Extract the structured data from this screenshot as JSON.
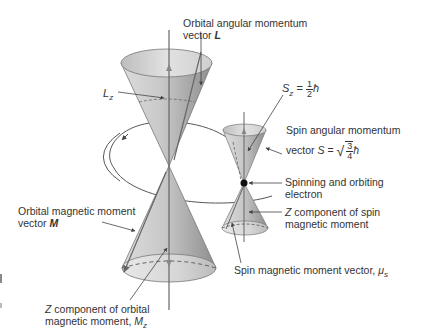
{
  "labels": {
    "orbital_L_line1": "Orbital angular momentum",
    "orbital_L_line2_prefix": "vector ",
    "orbital_L_symbol": "L",
    "Lz_symbol": "L",
    "Lz_sub": "z",
    "Sz_symbol": "S",
    "Sz_sub": "z",
    "Sz_eq": " = ",
    "Sz_num": "1",
    "Sz_den": "2",
    "Sz_hbar": "ħ",
    "spin_L_line1": "Spin angular momentum",
    "spin_L_line2_prefix": "vector ",
    "spin_L_symbol": "S",
    "spin_L_eq": " = ",
    "spin_num": "3",
    "spin_den": "4",
    "spin_hbar": "ħ",
    "electron_line1": "Spinning and orbiting",
    "electron_line2": "electron",
    "z_spin_line1_prefix": " component of spin",
    "z_spin_Z": "Z",
    "z_spin_line2": "magnetic moment",
    "orbital_M_line1": "Orbital magnetic moment",
    "orbital_M_line2_prefix": "vector ",
    "orbital_M_symbol": "M",
    "spin_mu_text": "Spin magnetic moment vector, ",
    "spin_mu_symbol": "μ",
    "spin_mu_sub": "s",
    "z_orbital_Z": "Z",
    "z_orbital_line1": " component of orbital",
    "z_orbital_line2_prefix": "magnetic moment, ",
    "z_orbital_symbol": "M",
    "z_orbital_sub": "z"
  },
  "colors": {
    "cone_light": "#e6e6e6",
    "cone_mid": "#c4c4c4",
    "cone_dark": "#9a9a9a",
    "line": "#555555",
    "text": "#333333"
  }
}
